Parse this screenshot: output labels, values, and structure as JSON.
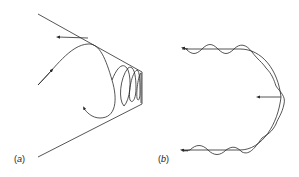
{
  "figure": {
    "panels": [
      {
        "id": "a",
        "label": "(a)",
        "open": "(",
        "letter": "a",
        "close": ")",
        "description": "Particle orbit reflecting in converging magnetic field (magnetic mirror)"
      },
      {
        "id": "b",
        "label": "(b)",
        "open": "(",
        "letter": "b",
        "close": ")",
        "description": "Gyrating particle drifting along curved field line"
      }
    ],
    "colors": {
      "line": "#2a2a2a",
      "background": "#ffffff"
    }
  }
}
